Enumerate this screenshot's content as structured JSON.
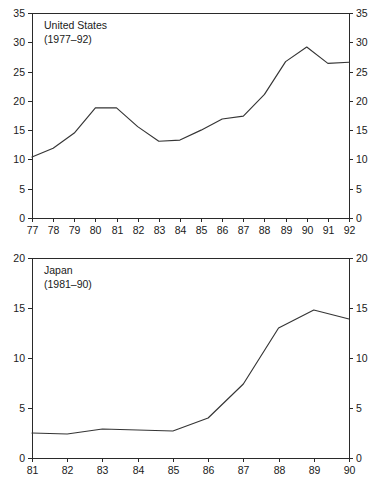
{
  "figure": {
    "background_color": "#ffffff",
    "line_color": "#353535",
    "axis_color": "#2a2a2a",
    "text_color": "#1a1a1a"
  },
  "chart_data": [
    {
      "type": "line",
      "title": "United States",
      "subtitle": "(1977–92)",
      "xlabel": "",
      "ylabel": "",
      "grid": false,
      "legend": "none",
      "xlim": [
        77,
        92
      ],
      "ylim": [
        0,
        35
      ],
      "yticks": [
        0,
        5,
        10,
        15,
        20,
        25,
        30,
        35
      ],
      "ytick_labels": [
        "0",
        "5",
        "10",
        "15",
        "20",
        "25",
        "30",
        "35"
      ],
      "y_axis_both_sides": true,
      "categories": [
        "77",
        "78",
        "79",
        "80",
        "81",
        "82",
        "83",
        "84",
        "85",
        "86",
        "87",
        "88",
        "89",
        "90",
        "91",
        "92"
      ],
      "x": [
        77,
        78,
        79,
        80,
        81,
        82,
        83,
        84,
        85,
        86,
        87,
        88,
        89,
        90,
        91,
        92
      ],
      "values": [
        10.4,
        11.9,
        14.5,
        18.8,
        18.8,
        15.6,
        13.1,
        13.3,
        15.0,
        16.9,
        17.4,
        21.1,
        26.7,
        29.2,
        26.4,
        26.6
      ],
      "series": [
        {
          "name": "United States",
          "values": [
            10.4,
            11.9,
            14.5,
            18.8,
            18.8,
            15.6,
            13.1,
            13.3,
            15.0,
            16.9,
            17.4,
            21.1,
            26.7,
            29.2,
            26.4,
            26.6
          ]
        }
      ]
    },
    {
      "type": "line",
      "title": "Japan",
      "subtitle": "(1981–90)",
      "xlabel": "",
      "ylabel": "",
      "grid": false,
      "legend": "none",
      "xlim": [
        81,
        90
      ],
      "ylim": [
        0,
        20
      ],
      "yticks": [
        0,
        5,
        10,
        15,
        20
      ],
      "ytick_labels": [
        "0",
        "5",
        "10",
        "15",
        "20"
      ],
      "y_axis_both_sides": true,
      "categories": [
        "81",
        "82",
        "83",
        "84",
        "85",
        "86",
        "87",
        "88",
        "89",
        "90"
      ],
      "x": [
        81,
        82,
        83,
        84,
        85,
        86,
        87,
        88,
        89,
        90
      ],
      "values": [
        2.5,
        2.4,
        2.9,
        2.8,
        2.7,
        4.0,
        7.4,
        13.0,
        14.8,
        13.9
      ],
      "series": [
        {
          "name": "Japan",
          "values": [
            2.5,
            2.4,
            2.9,
            2.8,
            2.7,
            4.0,
            7.4,
            13.0,
            14.8,
            13.9
          ]
        }
      ]
    }
  ]
}
